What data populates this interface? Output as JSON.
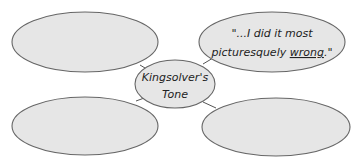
{
  "diagram": {
    "type": "concept-web",
    "center": {
      "line1": "Kingsolver's",
      "line2": "Tone"
    },
    "nodes": [
      {
        "position": "top-left",
        "line1": "",
        "line2": ""
      },
      {
        "position": "top-right",
        "line1": "\"...I did it most",
        "line2_pre": "picturesquely ",
        "line2_underlined": "wrong",
        "line2_post": ".\""
      },
      {
        "position": "bottom-left",
        "line1": "",
        "line2": ""
      },
      {
        "position": "bottom-right",
        "line1": "",
        "line2": ""
      }
    ]
  },
  "colors": {
    "fill": "#e6e6e6",
    "stroke": "#666666",
    "text": "#222222"
  }
}
